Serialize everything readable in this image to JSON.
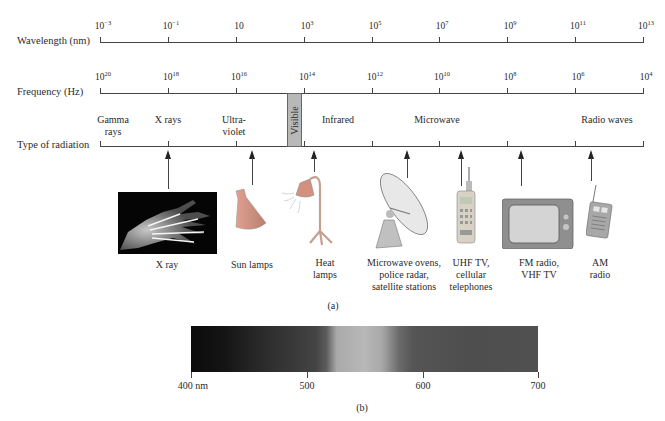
{
  "wavelength_axis": {
    "label": "Wavelength (nm)",
    "ticks": [
      {
        "base": "10",
        "exp": "−3"
      },
      {
        "base": "10",
        "exp": "−1"
      },
      {
        "base": "10",
        "exp": ""
      },
      {
        "base": "10",
        "exp": "3"
      },
      {
        "base": "10",
        "exp": "5"
      },
      {
        "base": "10",
        "exp": "7"
      },
      {
        "base": "10",
        "exp": "9"
      },
      {
        "base": "10",
        "exp": "11"
      },
      {
        "base": "10",
        "exp": "13"
      }
    ]
  },
  "frequency_axis": {
    "label": "Frequency (Hz)",
    "ticks": [
      {
        "base": "10",
        "exp": "20"
      },
      {
        "base": "10",
        "exp": "18"
      },
      {
        "base": "10",
        "exp": "16"
      },
      {
        "base": "10",
        "exp": "14"
      },
      {
        "base": "10",
        "exp": "12"
      },
      {
        "base": "10",
        "exp": "10"
      },
      {
        "base": "10",
        "exp": "8"
      },
      {
        "base": "10",
        "exp": "6"
      },
      {
        "base": "10",
        "exp": "4"
      }
    ]
  },
  "radiation_axis": {
    "label": "Type of radiation",
    "regions": [
      {
        "line1": "Gamma",
        "line2": "rays"
      },
      {
        "line1": "X rays",
        "line2": ""
      },
      {
        "line1": "Ultra-",
        "line2": "violet"
      },
      {
        "line1": "Infrared",
        "line2": ""
      },
      {
        "line1": "Microwave",
        "line2": ""
      },
      {
        "line1": "Radio waves",
        "line2": ""
      }
    ],
    "visible_label": "Visible"
  },
  "applications": [
    {
      "icon": "x-ray-hand-image",
      "lines": [
        "X ray"
      ]
    },
    {
      "icon": "sun-lamp-icon",
      "lines": [
        "Sun lamps"
      ]
    },
    {
      "icon": "heat-lamp-icon",
      "lines": [
        "Heat",
        "lamps"
      ]
    },
    {
      "icon": "satellite-dish-icon",
      "lines": [
        "Microwave ovens,",
        "police radar,",
        "satellite stations"
      ]
    },
    {
      "icon": "cellular-phone-icon",
      "lines": [
        "UHF TV,",
        "cellular",
        "telephones"
      ]
    },
    {
      "icon": "television-icon",
      "lines": [
        "FM radio,",
        "VHF TV"
      ]
    },
    {
      "icon": "am-radio-icon",
      "lines": [
        "AM",
        "radio"
      ]
    }
  ],
  "part_a_caption": "(a)",
  "visible_spectrum": {
    "ticks": [
      "400 nm",
      "500",
      "600",
      "700"
    ],
    "caption": "(b)"
  }
}
